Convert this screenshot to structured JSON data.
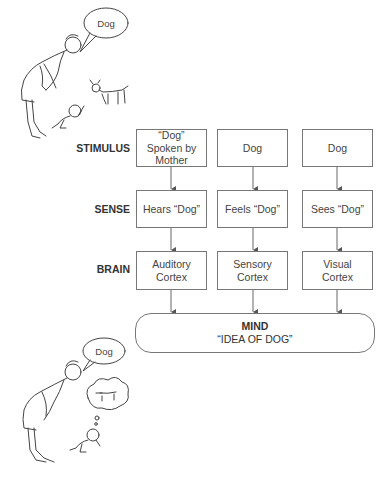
{
  "top_scene": {
    "speech_bubble": "Dog",
    "characters": [
      "mother",
      "baby",
      "dog"
    ]
  },
  "rows": [
    {
      "label": "STIMULUS",
      "boxes": [
        "“Dog”\nSpoken by\nMother",
        "Dog",
        "Dog"
      ]
    },
    {
      "label": "SENSE",
      "boxes": [
        "Hears “Dog”",
        "Feels “Dog”",
        "Sees “Dog”"
      ]
    },
    {
      "label": "BRAIN",
      "boxes": [
        "Auditory\nCortex",
        "Sensory\nCortex",
        "Visual\nCortex"
      ]
    }
  ],
  "mind": {
    "title": "MIND",
    "subtitle": "“IDEA OF DOG”"
  },
  "bottom_scene": {
    "speech_bubble": "Dog",
    "thought_bubble": "dog-image",
    "characters": [
      "mother",
      "baby"
    ]
  },
  "colors": {
    "line": "#777777",
    "text": "#333333",
    "background": "#ffffff"
  }
}
